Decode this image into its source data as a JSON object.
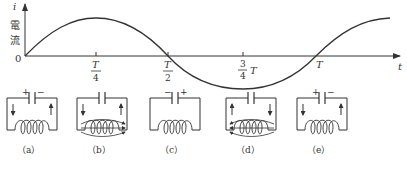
{
  "graph": {
    "y_axis_symbol": "i",
    "y_axis_label_line1": "電",
    "y_axis_label_line2": "流",
    "origin_label": "0",
    "x_axis_symbol": "t",
    "ticks": [
      {
        "numerator": "T",
        "denominator": "4",
        "suffix": ""
      },
      {
        "numerator": "T",
        "denominator": "2",
        "suffix": ""
      },
      {
        "numerator": "3",
        "denominator": "4",
        "suffix": "T"
      },
      {
        "label": "T"
      }
    ]
  },
  "circuits": [
    {
      "id": "a",
      "label": "（a）",
      "cap_left": "+",
      "cap_right": "−",
      "left_arrow": "down",
      "right_arrow": "up",
      "magnetic_field": false
    },
    {
      "id": "b",
      "label": "（b）",
      "cap_left": "",
      "cap_right": "",
      "left_arrow": "down",
      "right_arrow": "up",
      "magnetic_field": true,
      "field_direction": "right"
    },
    {
      "id": "c",
      "label": "（c）",
      "cap_left": "−",
      "cap_right": "+",
      "left_arrow": "none",
      "right_arrow": "none",
      "magnetic_field": false
    },
    {
      "id": "d",
      "label": "（d）",
      "cap_left": "",
      "cap_right": "",
      "left_arrow": "up",
      "right_arrow": "down",
      "magnetic_field": true,
      "field_direction": "left"
    },
    {
      "id": "e",
      "label": "（e）",
      "cap_left": "+",
      "cap_right": "−",
      "left_arrow": "down",
      "right_arrow": "up",
      "magnetic_field": false
    }
  ],
  "colors": {
    "line": "#333333",
    "background": "#ffffff"
  }
}
